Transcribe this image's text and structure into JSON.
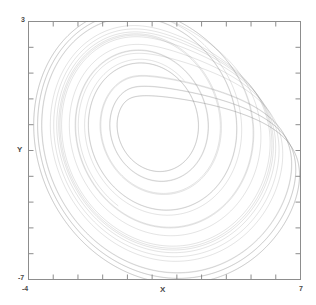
{
  "figure": {
    "background_color": "#ffffff",
    "frame_color": "#8d8d8d",
    "trace_color": "#7f7f7f"
  },
  "axes": {
    "x_title": "X",
    "y_title": "Y",
    "x_min_label": "-4",
    "x_max_label": "7",
    "y_min_label": "-7",
    "y_max_label": "3"
  },
  "chart_data": {
    "type": "line",
    "title": "",
    "subtitle": "",
    "xlabel": "X",
    "ylabel": "Y",
    "xlim": [
      -4,
      7
    ],
    "ylim": [
      -7,
      3
    ],
    "xticks": [
      -4,
      -3,
      -2,
      -1,
      0,
      1,
      2,
      3,
      4,
      5,
      6,
      7
    ],
    "yticks": [
      -7,
      -6,
      -5,
      -4,
      -3,
      -2,
      -1,
      0,
      1,
      2,
      3
    ],
    "xtick_labels": [
      "-4",
      "",
      "",
      "",
      "",
      "",
      "",
      "",
      "",
      "",
      "",
      "7"
    ],
    "ytick_labels": [
      "-7",
      "",
      "",
      "",
      "",
      "",
      "",
      "",
      "",
      "",
      "3"
    ],
    "grid": false,
    "legend": null,
    "legend_position": "none",
    "tick_direction": "in",
    "frame": "box",
    "annotations": [],
    "series": [
      {
        "name": "attractor trajectory",
        "description": "chaotic attractor phase portrait, nested spiral bands folding toward lower right",
        "n_points": 12000,
        "line_width": 0.35,
        "color": "#7f7f7f",
        "system": {
          "kind": "rossler-like",
          "a": 0.2,
          "b": 0.2,
          "c": 5.7,
          "dt": 0.012,
          "x0": 1.0,
          "y0": 1.0,
          "z0": 0.5,
          "transient_steps": 2500,
          "plot_steps": 12000
        }
      }
    ]
  }
}
